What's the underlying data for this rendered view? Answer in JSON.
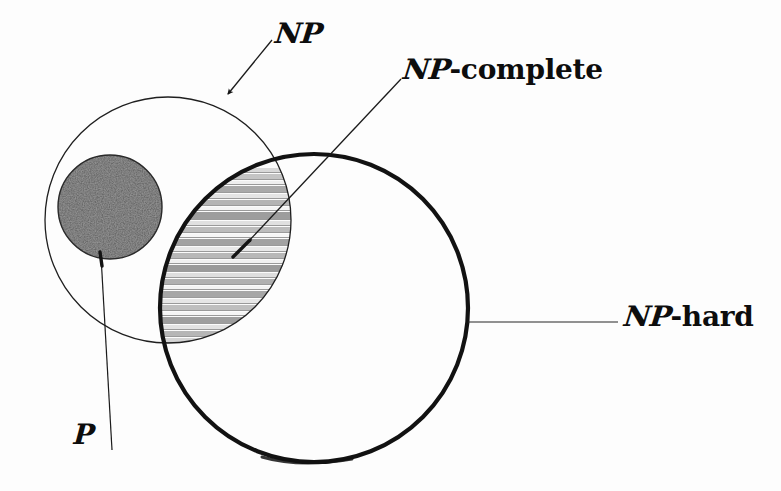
{
  "diagram": {
    "background_color": "#fdfdfd",
    "ink_color": "#0d0d0d"
  },
  "labels": {
    "np": {
      "script": "NP",
      "roman": "",
      "full": "NP"
    },
    "np_complete": {
      "script": "NP",
      "roman": "-complete",
      "full": "NP-complete"
    },
    "np_hard": {
      "script": "NP",
      "roman": "-hard",
      "full": "NP-hard"
    },
    "p": {
      "script": "P",
      "roman": "",
      "full": "P"
    }
  },
  "regions": {
    "np_circle": {
      "name": "NP",
      "shape": "circle",
      "cx": 168,
      "cy": 220,
      "r": 123,
      "stroke": "#1a1a1a",
      "stroke_width": 1.2,
      "fill": "none"
    },
    "np_hard_circle": {
      "name": "NP-hard",
      "shape": "circle",
      "cx": 314,
      "cy": 308,
      "r": 154,
      "stroke": "#111111",
      "stroke_width": 4,
      "fill": "none"
    },
    "p_circle": {
      "name": "P",
      "shape": "circle",
      "cx": 110,
      "cy": 207,
      "r": 52,
      "stroke": "#2b2b2b",
      "stroke_width": 1,
      "fill": "#4a4a4a",
      "texture": "stipple"
    },
    "np_complete_lens": {
      "name": "NP-complete",
      "shape": "intersection-of(np_circle, np_hard_circle)",
      "fill": "horizontal-stripes",
      "stripe_color_dark": "#8e8e8e",
      "stripe_color_light": "#f2f2f2"
    }
  },
  "leaders": [
    {
      "name": "np-leader",
      "from_label": "NP",
      "x1": 272,
      "y1": 40,
      "x2": 226,
      "y2": 97,
      "arrowhead": true
    },
    {
      "name": "np-complete-leader",
      "from_label": "NP-complete",
      "x1": 400,
      "y1": 80,
      "x2": 234,
      "y2": 256,
      "arrowhead": true
    },
    {
      "name": "np-hard-leader",
      "from_label": "NP-hard",
      "x1": 468,
      "y1": 322,
      "x2": 620,
      "y2": 322,
      "arrowhead": false
    },
    {
      "name": "p-leader",
      "from_label": "P",
      "x1": 100,
      "y1": 252,
      "x2": 110,
      "y2": 448,
      "arrowhead": true
    }
  ],
  "stripe_bands": [
    {
      "y": 168,
      "h": 4,
      "tone": "#d8d8d8"
    },
    {
      "y": 174,
      "h": 5,
      "tone": "#c4c4c4"
    },
    {
      "y": 181,
      "h": 3,
      "tone": "#efefef"
    },
    {
      "y": 186,
      "h": 6,
      "tone": "#a9a9a9"
    },
    {
      "y": 194,
      "h": 4,
      "tone": "#e4e4e4"
    },
    {
      "y": 200,
      "h": 5,
      "tone": "#b4b4b4"
    },
    {
      "y": 207,
      "h": 3,
      "tone": "#f4f4f4"
    },
    {
      "y": 212,
      "h": 7,
      "tone": "#9d9d9d"
    },
    {
      "y": 221,
      "h": 4,
      "tone": "#e0e0e0"
    },
    {
      "y": 227,
      "h": 5,
      "tone": "#bcbcbc"
    },
    {
      "y": 234,
      "h": 3,
      "tone": "#f6f6f6"
    },
    {
      "y": 239,
      "h": 6,
      "tone": "#a2a2a2"
    },
    {
      "y": 247,
      "h": 4,
      "tone": "#e8e8e8"
    },
    {
      "y": 253,
      "h": 5,
      "tone": "#b8b8b8"
    },
    {
      "y": 260,
      "h": 3,
      "tone": "#f1f1f1"
    },
    {
      "y": 265,
      "h": 6,
      "tone": "#9a9a9a"
    },
    {
      "y": 273,
      "h": 4,
      "tone": "#dedede"
    },
    {
      "y": 279,
      "h": 5,
      "tone": "#b0b0b0"
    },
    {
      "y": 286,
      "h": 3,
      "tone": "#f3f3f3"
    },
    {
      "y": 291,
      "h": 6,
      "tone": "#a6a6a6"
    },
    {
      "y": 299,
      "h": 4,
      "tone": "#e6e6e6"
    },
    {
      "y": 305,
      "h": 5,
      "tone": "#bfbfbf"
    },
    {
      "y": 312,
      "h": 3,
      "tone": "#f5f5f5"
    },
    {
      "y": 317,
      "h": 6,
      "tone": "#9e9e9e"
    },
    {
      "y": 325,
      "h": 4,
      "tone": "#e2e2e2"
    },
    {
      "y": 331,
      "h": 5,
      "tone": "#b6b6b6"
    },
    {
      "y": 338,
      "h": 4,
      "tone": "#d4d4d4"
    }
  ]
}
